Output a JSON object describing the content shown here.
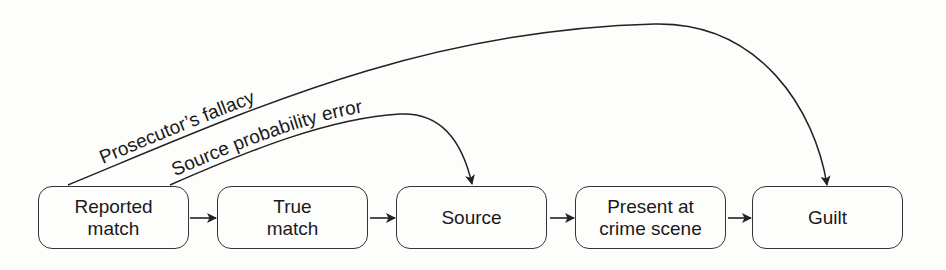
{
  "diagram": {
    "nodes": [
      {
        "id": "reported-match",
        "label": "Reported\nmatch"
      },
      {
        "id": "true-match",
        "label": "True\nmatch"
      },
      {
        "id": "source",
        "label": "Source"
      },
      {
        "id": "present-at-crime-scene",
        "label": "Present at\ncrime scene"
      },
      {
        "id": "guilt",
        "label": "Guilt"
      }
    ],
    "edges": [
      {
        "from": "reported-match",
        "to": "true-match"
      },
      {
        "from": "true-match",
        "to": "source"
      },
      {
        "from": "source",
        "to": "present-at-crime-scene"
      },
      {
        "from": "present-at-crime-scene",
        "to": "guilt"
      }
    ],
    "errors": [
      {
        "label": "Prosecutor’s fallacy",
        "from": "reported-match",
        "to": "guilt"
      },
      {
        "label": "Source probability error",
        "from": "reported-match",
        "to": "source"
      }
    ]
  }
}
